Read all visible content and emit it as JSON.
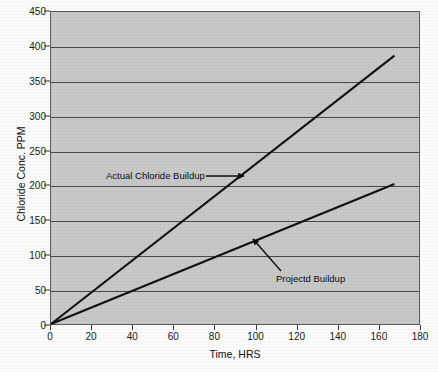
{
  "chart_data": {
    "type": "line",
    "title": "",
    "xlabel": "Time, HRS",
    "ylabel": "Chloride Conc. PPM",
    "xlim": [
      0,
      180
    ],
    "ylim": [
      0,
      450
    ],
    "xticks": [
      0,
      20,
      40,
      60,
      80,
      100,
      120,
      140,
      160,
      180
    ],
    "yticks": [
      0,
      50,
      100,
      150,
      200,
      250,
      300,
      350,
      400,
      450
    ],
    "grid": "horizontal",
    "legend_position": "none",
    "plot_background": "#c9c9c9",
    "line_color": "#111111",
    "series": [
      {
        "name": "Actual Chloride Buildup",
        "points": [
          [
            0,
            0
          ],
          [
            168,
            387
          ]
        ],
        "slope_ppm_per_hr": 2.3
      },
      {
        "name": "Projectd Buildup",
        "points": [
          [
            0,
            0
          ],
          [
            168,
            202
          ]
        ],
        "slope_ppm_per_hr": 1.2
      }
    ],
    "annotations": [
      {
        "text": "Actual Chloride Buildup",
        "arrow": "right",
        "label_xy": [
          32,
          218
        ],
        "target_xy": [
          94,
          216
        ]
      },
      {
        "text": "Projectd Buildup",
        "arrow": "up-left",
        "label_xy": [
          112,
          77
        ],
        "target_xy": [
          99,
          131
        ]
      }
    ]
  },
  "axes": {
    "y_title": "Chloride Conc. PPM",
    "x_title": "Time, HRS",
    "y_tick_labels": [
      "450",
      "400",
      "350",
      "300",
      "250",
      "200",
      "150",
      "100",
      "50",
      "0"
    ],
    "x_tick_labels": [
      "0",
      "20",
      "40",
      "60",
      "80",
      "100",
      "120",
      "140",
      "160",
      "180"
    ]
  },
  "annotations": {
    "actual_label": "Actual Chloride Buildup",
    "projected_label": "Projectd Buildup"
  }
}
